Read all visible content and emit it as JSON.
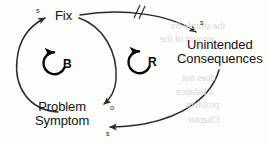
{
  "diagram": {
    "type": "causal-loop-diagram",
    "archetype_name": "Fixes That Fail",
    "background_color": "#fdfdfc",
    "stroke_color": "#2b2b2b",
    "text_color": "#111111",
    "nodes": [
      {
        "id": "fix",
        "lines": [
          "Fix"
        ],
        "x": 55,
        "y": 9
      },
      {
        "id": "unintended-consequences",
        "lines": [
          "Unintended",
          "Consequences"
        ],
        "x": 177,
        "y": 38
      },
      {
        "id": "problem-symptom",
        "lines": [
          "Problem",
          "Symptom"
        ],
        "x": 35,
        "y": 100
      }
    ],
    "loops": [
      {
        "id": "balancing-loop",
        "letter": "B",
        "letter_x": 63,
        "letter_y": 58,
        "center_x": 54,
        "center_y": 63,
        "radius": 11
      },
      {
        "id": "reinforcing-loop",
        "letter": "R",
        "letter_x": 148,
        "letter_y": 56,
        "center_x": 139,
        "center_y": 62,
        "radius": 11
      }
    ],
    "links": [
      {
        "id": "problem-symptom-to-fix",
        "from": "problem-symptom",
        "to": "fix",
        "polarity": "s",
        "polarity_x": 36,
        "polarity_y": 7,
        "delay": false
      },
      {
        "id": "fix-to-problem-symptom",
        "from": "fix",
        "to": "problem-symptom",
        "polarity": "o",
        "polarity_x": 110,
        "polarity_y": 104,
        "delay": false
      },
      {
        "id": "fix-to-unintended-consequences",
        "from": "fix",
        "to": "unintended-consequences",
        "polarity": "s",
        "polarity_x": 200,
        "polarity_y": 19,
        "delay": true,
        "delay_label": "//"
      },
      {
        "id": "unintended-consequences-to-problem-symptom",
        "from": "unintended-consequences",
        "to": "problem-symptom",
        "polarity": "s",
        "polarity_x": 106,
        "polarity_y": 130,
        "delay": false
      }
    ],
    "bleed_text": [
      {
        "text": "the simple fix",
        "x": 170,
        "y": 20
      },
      {
        "text": "amount of the",
        "x": 160,
        "y": 33
      },
      {
        "text": "does not",
        "x": 182,
        "y": 72
      },
      {
        "text": "a balance",
        "x": 176,
        "y": 86
      },
      {
        "text": "problem",
        "x": 186,
        "y": 99
      },
      {
        "text": "Chapter",
        "x": 188,
        "y": 114
      }
    ]
  }
}
